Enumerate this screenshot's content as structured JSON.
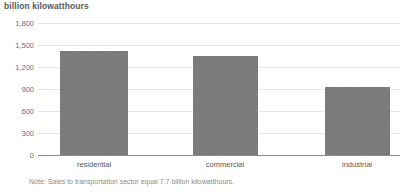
{
  "chart_data": {
    "type": "bar",
    "title": "billion kilowatthours",
    "subtitle": "",
    "xlabel": "",
    "ylabel": "",
    "categories": [
      "residential",
      "commercial",
      "industrial"
    ],
    "values": [
      1420,
      1350,
      925
    ],
    "series": [
      {
        "name": "Electricity sales",
        "values": [
          1420,
          1350,
          925
        ]
      }
    ],
    "ylim": [
      0,
      1800
    ],
    "ytick_labels": [
      "0",
      "300",
      "600",
      "900",
      "1,200",
      "1,500",
      "1,800"
    ],
    "ytick_values": [
      0,
      300,
      600,
      900,
      1200,
      1500,
      1800
    ],
    "grid": true,
    "legend": "none",
    "annotations": [
      "Note: Sales to transportation sector equal 7.7 billion kilowatthours."
    ],
    "bar_color": "#7b7b7b",
    "grid_color": "#e8e8e8",
    "axis_color": "#8b8b8b",
    "text_color": "#58595b"
  },
  "note": {
    "text": "Note: Sales to transportation sector equal 7.7 billion kilowatthours."
  }
}
